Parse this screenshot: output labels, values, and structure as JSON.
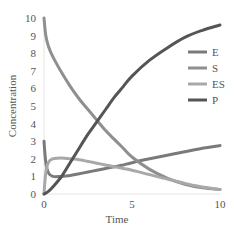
{
  "chart_data": {
    "type": "line",
    "title": "",
    "xlabel": "Time",
    "ylabel": "Concentration",
    "xlim": [
      0,
      10
    ],
    "ylim": [
      0,
      10
    ],
    "x_ticks": [
      "0",
      "5",
      "10"
    ],
    "y_ticks": [
      "0",
      "1",
      "2",
      "3",
      "4",
      "5",
      "6",
      "7",
      "8",
      "9",
      "10"
    ],
    "grid": false,
    "legend_position": "right",
    "x": [
      0,
      0.1,
      0.25,
      0.5,
      1,
      1.5,
      2,
      2.5,
      3,
      3.5,
      4,
      4.5,
      5,
      6,
      7,
      8,
      9,
      10
    ],
    "series": [
      {
        "name": "E",
        "color": "#7a7a7a",
        "values": [
          3.0,
          1.8,
          1.2,
          1.0,
          1.0,
          1.05,
          1.15,
          1.25,
          1.35,
          1.45,
          1.55,
          1.65,
          1.78,
          2.0,
          2.2,
          2.4,
          2.6,
          2.75
        ]
      },
      {
        "name": "S",
        "color": "#8f8f8f",
        "values": [
          10.0,
          9.0,
          8.4,
          7.8,
          6.9,
          6.1,
          5.4,
          4.8,
          4.2,
          3.6,
          3.1,
          2.6,
          2.1,
          1.4,
          0.9,
          0.55,
          0.35,
          0.25
        ]
      },
      {
        "name": "ES",
        "color": "#a8a8a8",
        "values": [
          0.0,
          1.2,
          1.8,
          2.0,
          2.05,
          2.0,
          1.95,
          1.85,
          1.75,
          1.65,
          1.55,
          1.45,
          1.35,
          1.1,
          0.85,
          0.6,
          0.4,
          0.25
        ]
      },
      {
        "name": "P",
        "color": "#555555",
        "values": [
          0.0,
          0.05,
          0.15,
          0.4,
          1.0,
          1.8,
          2.6,
          3.4,
          4.1,
          4.8,
          5.5,
          6.1,
          6.7,
          7.6,
          8.3,
          8.9,
          9.3,
          9.6
        ]
      }
    ]
  },
  "legend": [
    {
      "label": "E"
    },
    {
      "label": "S"
    },
    {
      "label": "ES"
    },
    {
      "label": "P"
    }
  ]
}
